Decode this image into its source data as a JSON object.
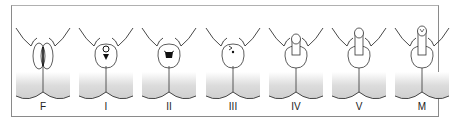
{
  "stages": [
    {
      "label": "F",
      "type": "female"
    },
    {
      "label": "I",
      "type": "stage1"
    },
    {
      "label": "II",
      "type": "stage2"
    },
    {
      "label": "III",
      "type": "stage3"
    },
    {
      "label": "IV",
      "type": "stage4"
    },
    {
      "label": "V",
      "type": "stage5"
    },
    {
      "label": "M",
      "type": "male"
    }
  ],
  "colors": {
    "line": "#333333",
    "shade_top": "#ffffff",
    "shade_bottom": "#c8c8c8",
    "border": "#8a8a8a"
  }
}
